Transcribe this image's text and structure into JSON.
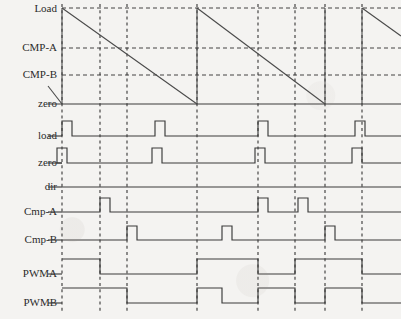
{
  "figure": {
    "kind": "timing-diagram",
    "title": "",
    "background_color": "#f4f3f1",
    "line_color": "#3a3a3a"
  },
  "labels": {
    "load_level": "Load",
    "cmp_a_level": "CMP-A",
    "cmp_b_level": "CMP-B",
    "zero_level": "zero",
    "load_signal": "load",
    "zero_signal": "zero",
    "dir_signal": "dir",
    "cmp_a_signal": "Cmp-A",
    "cmp_b_signal": "Cmp-B",
    "pwma_signal": "PWMA",
    "pwmb_signal": "PWMB"
  },
  "chart_data": {
    "type": "line",
    "title": "",
    "xlabel": "",
    "ylabel": "",
    "grid": true,
    "legend_position": "left-labels",
    "x_axis": {
      "min": 62,
      "max": 401,
      "unit": "px"
    },
    "marker_lines_x": [
      62,
      100,
      127,
      197,
      258,
      295,
      325,
      362
    ],
    "counter": {
      "name": "Counter",
      "mode": "down-count sawtooth",
      "levels": {
        "Load": 8,
        "CMP-A": 48,
        "CMP-B": 75,
        "zero": 104
      },
      "level_labels": [
        "Load",
        "CMP-A",
        "CMP-B",
        "zero"
      ],
      "segments": [
        {
          "from_x": 48,
          "from_y": 86,
          "to_x": 62,
          "to_y": 104
        },
        {
          "from_x": 62,
          "from_y": 8,
          "to_x": 197,
          "to_y": 104
        },
        {
          "from_x": 197,
          "from_y": 8,
          "to_x": 325,
          "to_y": 104
        },
        {
          "from_x": 362,
          "from_y": 8,
          "to_x": 401,
          "to_y": 36
        }
      ],
      "reload_edges_x": [
        62,
        197,
        325,
        362
      ],
      "cmp_a_crossings_x": [
        100,
        258
      ],
      "cmp_b_crossings_x": [
        127,
        295
      ]
    },
    "signals": [
      {
        "name": "load",
        "label": "load",
        "baseline_y": 136,
        "high_y": 121,
        "default_level": "low",
        "pulses": [
          {
            "start_x": 62,
            "end_x": 72
          },
          {
            "start_x": 155,
            "end_x": 165
          },
          {
            "start_x": 258,
            "end_x": 268
          },
          {
            "start_x": 355,
            "end_x": 365
          }
        ]
      },
      {
        "name": "zero",
        "label": "zero",
        "baseline_y": 163,
        "high_y": 148,
        "default_level": "low",
        "pulses": [
          {
            "start_x": 57,
            "end_x": 67
          },
          {
            "start_x": 152,
            "end_x": 162
          },
          {
            "start_x": 255,
            "end_x": 265
          },
          {
            "start_x": 352,
            "end_x": 362
          }
        ]
      },
      {
        "name": "dir",
        "label": "dir",
        "baseline_y": 187,
        "high_y": 172,
        "default_level": "low",
        "pulses": []
      },
      {
        "name": "Cmp-A",
        "label": "Cmp-A",
        "baseline_y": 212,
        "high_y": 198,
        "default_level": "low",
        "pulses": [
          {
            "start_x": 100,
            "end_x": 110
          },
          {
            "start_x": 258,
            "end_x": 268
          },
          {
            "start_x": 298,
            "end_x": 308
          }
        ]
      },
      {
        "name": "Cmp-B",
        "label": "Cmp-B",
        "baseline_y": 240,
        "high_y": 226,
        "default_level": "low",
        "pulses": [
          {
            "start_x": 127,
            "end_x": 137
          },
          {
            "start_x": 222,
            "end_x": 232
          },
          {
            "start_x": 325,
            "end_x": 335
          }
        ]
      },
      {
        "name": "PWMA",
        "label": "PWMA",
        "baseline_y": 274,
        "high_y": 259,
        "default_level": "low",
        "transitions_x": [
          62,
          100,
          197,
          258,
          295,
          362
        ],
        "start_level": "low",
        "note": "toggles on load edge and Cmp-A match"
      },
      {
        "name": "PWMB",
        "label": "PWMB",
        "baseline_y": 303,
        "high_y": 288,
        "default_level": "low",
        "transitions_x": [
          62,
          127,
          197,
          222,
          258,
          295,
          325,
          362
        ],
        "start_level": "low",
        "note": "toggles on load edge and Cmp-B match"
      }
    ]
  }
}
